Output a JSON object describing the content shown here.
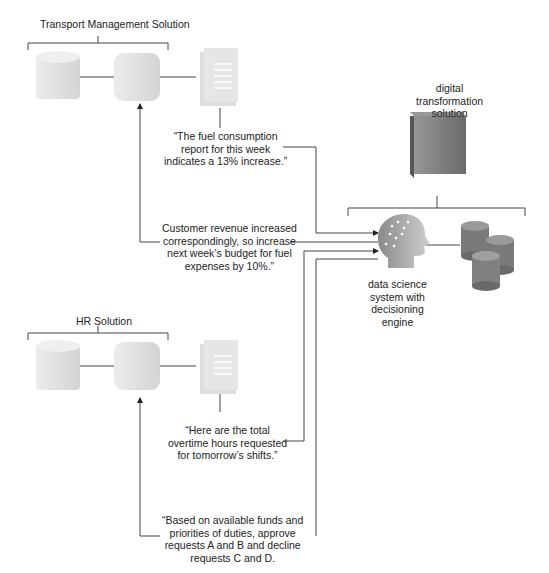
{
  "systems": {
    "transport": {
      "title": "Transport Management Solution",
      "report_message": [
        "“The fuel consumption",
        "report for this week",
        "indicates a 13% increase.”"
      ],
      "response_message": [
        "Customer revenue increased",
        "correspondingly, so increase",
        "next week’s budget for fuel",
        "expenses by 10%.”"
      ]
    },
    "hr": {
      "title": "HR Solution",
      "report_message": [
        "“Here are the total",
        "overtime hours requested",
        "for tomorrow’s shifts.”"
      ],
      "response_message": [
        "“Based on available funds and",
        "priorities of duties, approve",
        "requests A and B and decline",
        "requests C and D."
      ]
    },
    "digital": {
      "title": [
        "digital",
        "transformation",
        "solution"
      ],
      "engine_label": [
        "data science",
        "system with",
        "decisioning",
        "engine"
      ]
    }
  },
  "icons": {
    "database": "database-icon",
    "application": "application-icon",
    "report": "document-report-icon",
    "server": "server-cube-icon",
    "brain": "head-brain-icon",
    "storage": "database-cluster-icon"
  },
  "colors": {
    "line": "#444444",
    "light_icon": "#e2e2e2",
    "dark_icon": "#7a7a7a"
  }
}
